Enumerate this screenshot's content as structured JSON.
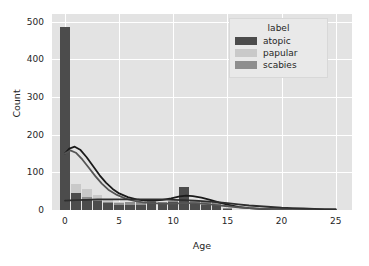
{
  "chart_data": {
    "type": "bar",
    "title": "",
    "subtitle": "",
    "xlabel": "Age",
    "ylabel": "Count",
    "xlim": [
      -1.2,
      26.5
    ],
    "ylim": [
      0,
      520
    ],
    "xticks": [
      0,
      5,
      10,
      15,
      20,
      25
    ],
    "yticks": [
      0,
      100,
      200,
      300,
      400,
      500
    ],
    "grid": true,
    "legend_position": "upper right",
    "legend_title": "label",
    "bin_width": 1,
    "series": [
      {
        "name": "atopic",
        "color": "#4c4c4c",
        "x": [
          0,
          1,
          2,
          3,
          4,
          5,
          6,
          7,
          8,
          9,
          10,
          11,
          12,
          13,
          14,
          15
        ],
        "values": [
          485,
          46,
          30,
          24,
          18,
          14,
          12,
          13,
          20,
          16,
          22,
          60,
          18,
          12,
          14,
          4
        ]
      },
      {
        "name": "papular",
        "color": "#c9c9c9",
        "x": [
          0,
          1,
          2,
          3,
          4,
          5,
          6,
          7,
          8,
          9,
          10,
          11,
          12,
          13,
          14,
          15
        ],
        "values": [
          40,
          68,
          55,
          40,
          30,
          22,
          16,
          10,
          8,
          6,
          8,
          6,
          10,
          6,
          4,
          2
        ]
      },
      {
        "name": "scabies",
        "color": "#8e8e8e",
        "x": [
          0,
          1,
          2,
          3,
          4,
          5,
          6,
          7,
          8,
          9,
          10,
          11,
          12,
          13,
          14,
          15
        ],
        "values": [
          24,
          40,
          34,
          28,
          22,
          18,
          20,
          22,
          26,
          20,
          24,
          26,
          24,
          22,
          20,
          6
        ]
      }
    ],
    "kde_curves": [
      {
        "name": "atopic-kde",
        "color": "#1a1a1a",
        "points": [
          [
            0,
            150
          ],
          [
            0.4,
            163
          ],
          [
            0.9,
            168
          ],
          [
            1.4,
            160
          ],
          [
            2,
            140
          ],
          [
            2.6,
            116
          ],
          [
            3.2,
            92
          ],
          [
            3.8,
            72
          ],
          [
            4.4,
            56
          ],
          [
            5,
            44
          ],
          [
            5.8,
            34
          ],
          [
            6.6,
            28
          ],
          [
            7.4,
            25
          ],
          [
            8.2,
            25
          ],
          [
            9,
            27
          ],
          [
            9.8,
            31
          ],
          [
            10.6,
            36
          ],
          [
            11.2,
            38
          ],
          [
            11.8,
            37
          ],
          [
            12.6,
            33
          ],
          [
            13.4,
            27
          ],
          [
            14.2,
            20
          ],
          [
            15,
            14
          ],
          [
            16,
            8
          ],
          [
            17,
            5
          ],
          [
            18,
            3
          ],
          [
            19,
            2
          ],
          [
            20,
            1
          ],
          [
            22,
            1
          ],
          [
            25,
            0
          ]
        ]
      },
      {
        "name": "papular-kde",
        "color": "#555555",
        "points": [
          [
            0,
            150
          ],
          [
            0.5,
            158
          ],
          [
            1,
            152
          ],
          [
            1.6,
            134
          ],
          [
            2.2,
            112
          ],
          [
            2.8,
            90
          ],
          [
            3.4,
            70
          ],
          [
            4,
            54
          ],
          [
            4.8,
            40
          ],
          [
            5.6,
            30
          ],
          [
            6.4,
            24
          ],
          [
            7.2,
            20
          ],
          [
            8,
            18
          ],
          [
            9,
            17
          ],
          [
            10,
            17
          ],
          [
            11,
            18
          ],
          [
            12,
            18
          ],
          [
            13,
            16
          ],
          [
            14,
            13
          ],
          [
            15,
            10
          ],
          [
            16,
            7
          ],
          [
            17,
            5
          ],
          [
            18,
            3
          ],
          [
            20,
            2
          ],
          [
            22,
            1
          ],
          [
            25,
            0
          ]
        ]
      },
      {
        "name": "scabies-kde",
        "color": "#2e2e2e",
        "points": [
          [
            0,
            25
          ],
          [
            1,
            26
          ],
          [
            2,
            27
          ],
          [
            3,
            28
          ],
          [
            4,
            28
          ],
          [
            5,
            28
          ],
          [
            6,
            28
          ],
          [
            7,
            28
          ],
          [
            8,
            28
          ],
          [
            9,
            28
          ],
          [
            10,
            27
          ],
          [
            11,
            26
          ],
          [
            12,
            25
          ],
          [
            13,
            23
          ],
          [
            14,
            21
          ],
          [
            15,
            18
          ],
          [
            16,
            15
          ],
          [
            17,
            12
          ],
          [
            18,
            10
          ],
          [
            19,
            8
          ],
          [
            20,
            6
          ],
          [
            21,
            5
          ],
          [
            22,
            4
          ],
          [
            23,
            3
          ],
          [
            24,
            2
          ],
          [
            25,
            2
          ]
        ]
      }
    ]
  },
  "legend": {
    "title": "label",
    "items": [
      {
        "label": "atopic",
        "color": "#4c4c4c"
      },
      {
        "label": "papular",
        "color": "#c9c9c9"
      },
      {
        "label": "scabies",
        "color": "#8e8e8e"
      }
    ]
  }
}
